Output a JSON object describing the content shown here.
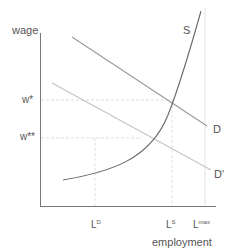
{
  "diagram": {
    "axes": {
      "y_label": "wage",
      "x_label": "employment"
    },
    "wage_levels": [
      {
        "id": "w_star",
        "label": "w*"
      },
      {
        "id": "w_star_star",
        "label": "w**"
      }
    ],
    "employment_levels": [
      {
        "id": "LD",
        "base": "L",
        "sup": "D"
      },
      {
        "id": "LS",
        "base": "L",
        "sup": "S"
      },
      {
        "id": "Lmax",
        "base": "L",
        "sup": "max"
      }
    ],
    "curves": [
      {
        "id": "S",
        "label": "S",
        "type": "supply",
        "shape": "convex upward"
      },
      {
        "id": "D",
        "label": "D",
        "type": "demand",
        "shape": "linear downward"
      },
      {
        "id": "D_prime",
        "label": "D'",
        "type": "demand",
        "shape": "linear downward (shifted left)"
      }
    ],
    "colors": {
      "axis": "#777777",
      "supply": "#666666",
      "demand": "#999999",
      "demand_shifted": "#bbbbbb",
      "guides": "#dddddd",
      "text": "#555555"
    }
  }
}
